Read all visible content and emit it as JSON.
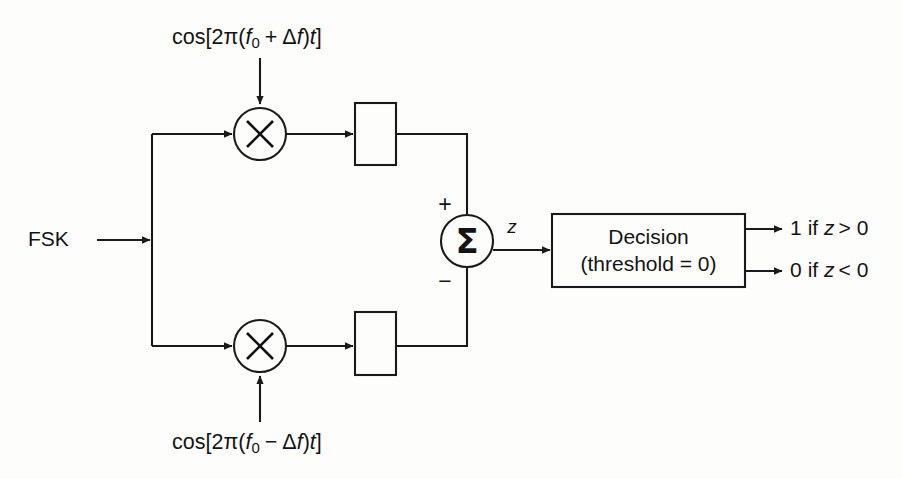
{
  "figure": {
    "background_color": "#fdfdfc",
    "line_color": "#1a1a1a",
    "text_color": "#141414"
  },
  "inputs": {
    "signal_label": "FSK",
    "upper_carrier": {
      "prefix": "cos[2π(",
      "f_symbol": "f",
      "f_subscript": "0",
      "operator": "+",
      "delta": "Δ",
      "delta_var": "f",
      "close": ")",
      "time_var": "t",
      "bracket": "]",
      "full_text": "cos[2π(f0 + Δf)t]"
    },
    "lower_carrier": {
      "prefix": "cos[2π(",
      "f_symbol": "f",
      "f_subscript": "0",
      "operator": "−",
      "delta": "Δ",
      "delta_var": "f",
      "close": ")",
      "time_var": "t",
      "bracket": "]",
      "full_text": "cos[2π(f0 − Δf)t]"
    }
  },
  "nodes": {
    "upper_multiplier": {
      "glyph": "×",
      "name": "multiplier"
    },
    "lower_multiplier": {
      "glyph": "×",
      "name": "multiplier"
    },
    "upper_filter_box": {
      "label": ""
    },
    "lower_filter_box": {
      "label": ""
    },
    "summer": {
      "glyph": "Σ",
      "plus_sign": "+",
      "minus_sign": "−",
      "output_label": "z"
    },
    "decision_block": {
      "line1": "Decision",
      "line2": "(threshold = 0)"
    }
  },
  "outputs": [
    {
      "value": "1",
      "condition": "if z > 0",
      "text": "1 if z > 0"
    },
    {
      "value": "0",
      "condition": "if z < 0",
      "text": "0 if z < 0"
    }
  ]
}
